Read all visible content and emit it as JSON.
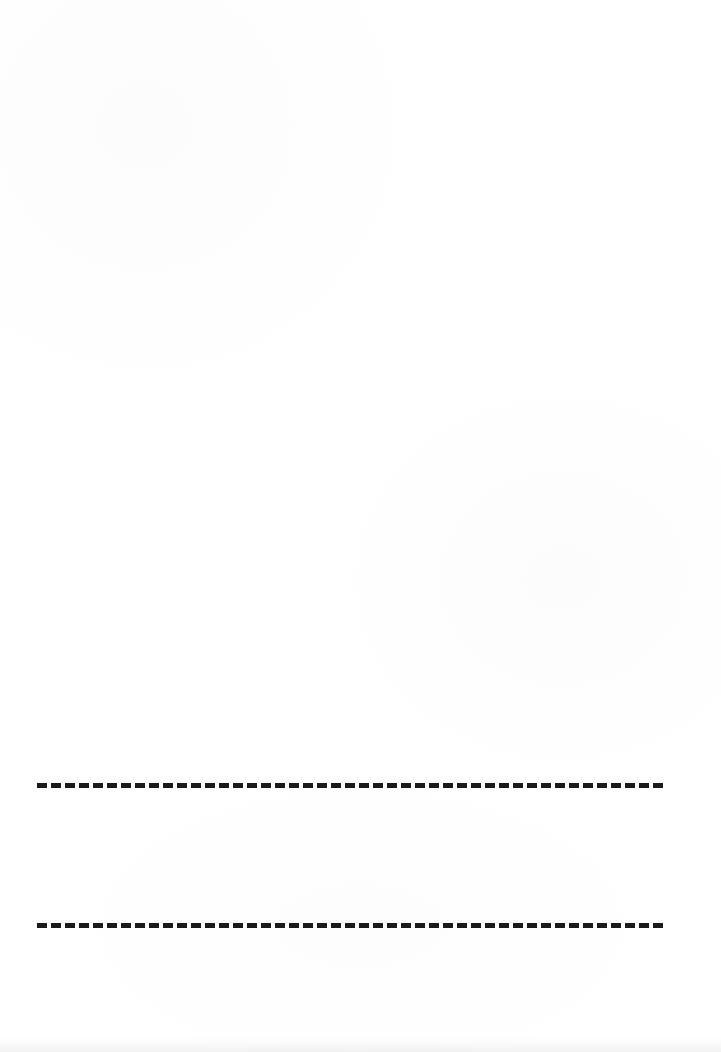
{
  "page": {
    "width": 721,
    "height": 1052,
    "background_color": "#ffffff",
    "ink_color": "#1a1a1a"
  },
  "rules": [
    {
      "name": "upper-dashed-rule",
      "x_start": 37,
      "x_end": 672,
      "y_center": 785,
      "thickness": 5,
      "dash_length": 10,
      "gap_length": 4,
      "dash_count": 45,
      "color": "#1a1a1a",
      "style": "dashed"
    },
    {
      "name": "lower-dashed-rule",
      "x_start": 37,
      "x_end": 672,
      "y_center": 925,
      "thickness": 5,
      "dash_length": 10,
      "gap_length": 4,
      "dash_count": 45,
      "color": "#1a1a1a",
      "style": "dashed"
    }
  ],
  "artifacts": {
    "bottom_edge_smudge": "faint grey scanner band along bottom edge",
    "paper_grain": "very light mottling across the white field"
  }
}
